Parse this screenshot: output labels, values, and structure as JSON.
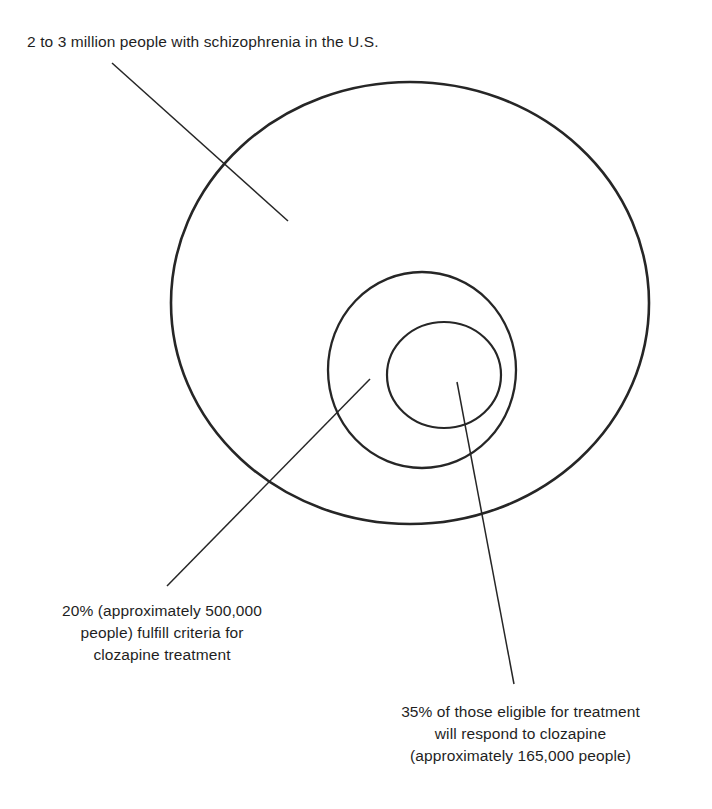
{
  "diagram": {
    "type": "nested-circles",
    "background_color": "#ffffff",
    "stroke_color": "#262626",
    "text_color": "#1f1f1f",
    "labels": {
      "outer": "2 to 3 million people with schizophrenia in the U.S.",
      "middle": "20% (approximately 500,000\npeople) fulfill criteria for\nclozapine treatment",
      "inner": "35% of those eligible for treatment\nwill respond to clozapine\n(approximately 165,000 people)"
    },
    "circles": [
      {
        "name": "outer-circle",
        "label_key": "outer",
        "cx": 410,
        "cy": 303,
        "rx": 239,
        "ry": 221,
        "stroke_width": 2.6,
        "population": "2 to 3 million",
        "share_of_parent": "100%"
      },
      {
        "name": "middle-circle",
        "label_key": "middle",
        "cx": 422,
        "cy": 370,
        "rx": 94,
        "ry": 98,
        "stroke_width": 2.3,
        "population": "approximately 500,000",
        "share_of_parent": "20%"
      },
      {
        "name": "inner-circle",
        "label_key": "inner",
        "cx": 444,
        "cy": 375,
        "rx": 57,
        "ry": 53,
        "stroke_width": 2.2,
        "population": "approximately 165,000",
        "share_of_parent": "35%"
      }
    ],
    "leader_lines": [
      {
        "name": "leader-line-outer",
        "from": [
          112,
          63
        ],
        "to": [
          288,
          221
        ],
        "stroke_width": 1.5,
        "target": "outer-circle"
      },
      {
        "name": "leader-line-middle",
        "from": [
          167,
          586
        ],
        "to": [
          370,
          379
        ],
        "stroke_width": 1.5,
        "target": "middle-circle"
      },
      {
        "name": "leader-line-inner",
        "from": [
          514,
          684
        ],
        "to": [
          457,
          382
        ],
        "stroke_width": 1.5,
        "target": "inner-circle"
      }
    ]
  },
  "chart_data": {
    "type": "pie",
    "categories": [
      "People with schizophrenia in the U.S.",
      "Fulfill criteria for clozapine treatment",
      "Will respond to clozapine"
    ],
    "values": [
      2500000,
      500000,
      165000
    ],
    "value_labels": [
      "2 to 3 million",
      "approximately 500,000",
      "approximately 165,000"
    ],
    "percent_of_parent": [
      100,
      20,
      35
    ],
    "annotations": [
      "2 to 3 million people with schizophrenia in the U.S.",
      "20% (approximately 500,000 people) fulfill criteria for clozapine treatment",
      "35% of those eligible for treatment will respond to clozapine (approximately 165,000 people)"
    ],
    "xlabel": "",
    "ylabel": "",
    "grid": false,
    "legend": "none",
    "nesting": "proportional-nested-circles"
  }
}
